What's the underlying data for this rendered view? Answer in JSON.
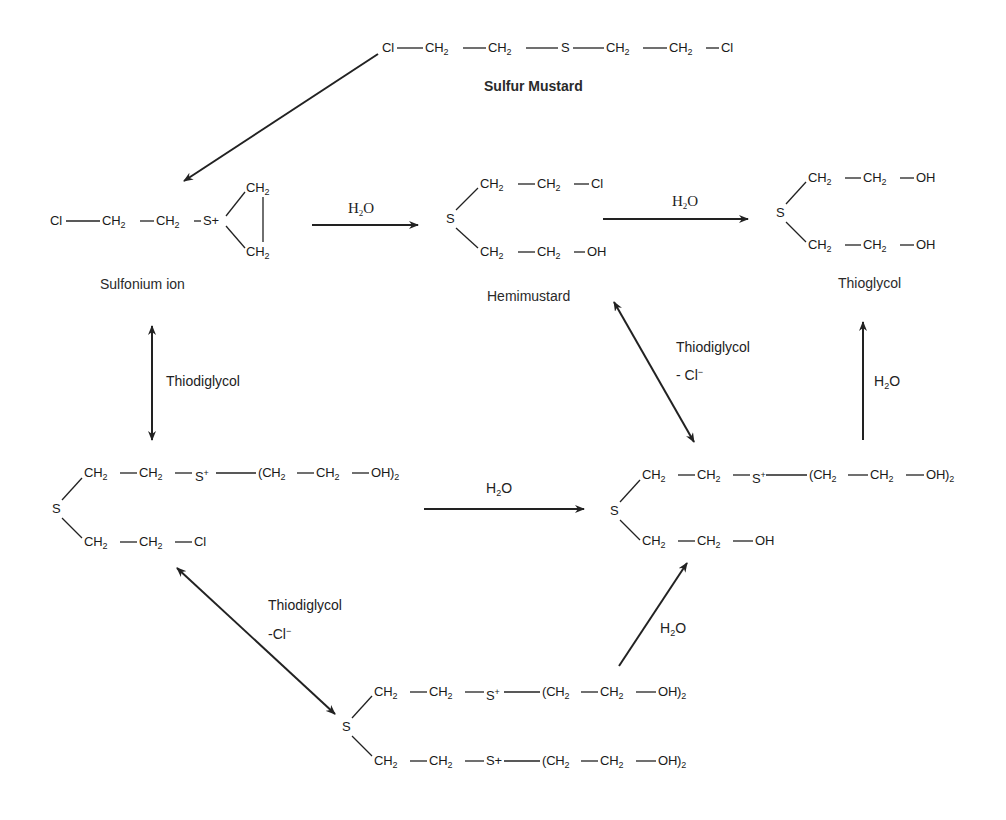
{
  "compounds": {
    "sulfur_mustard": {
      "name": "Sulfur Mustard",
      "formula_parts": [
        "Cl",
        "CH2",
        "CH2",
        "S",
        "CH2",
        "CH2",
        "Cl"
      ],
      "formula_text": "Cl—CH2—CH2—S—CH2—CH2—Cl"
    },
    "sulfonium_ion": {
      "name": "Sulfonium ion",
      "formula_text": "Cl—CH2—CH2—S+ (ring with CH2, CH2)"
    },
    "hemimustard": {
      "name": "Hemimustard",
      "upper_branch": "CH2—CH2—Cl",
      "lower_branch": "CH2—CH2—OH",
      "center": "S"
    },
    "thioglycol": {
      "name": "Thioglycol",
      "upper_branch": "CH2—CH2—OH",
      "lower_branch": "CH2—CH2—OH",
      "center": "S"
    },
    "intermediate_left": {
      "upper_branch": "CH2—CH2—S+—(CH2—CH2—OH)2",
      "lower_branch": "CH2—CH2—Cl",
      "center": "S"
    },
    "intermediate_right": {
      "upper_branch": "CH2—CH2—S+—(CH2—CH2—OH)2",
      "lower_branch": "CH2—CH2—OH",
      "center": "S"
    },
    "intermediate_bottom": {
      "upper_branch": "CH2—CH2—S+—(CH2—CH2—OH)2",
      "lower_branch": "CH2—CH2—S+—(CH2—CH2—OH)2",
      "center": "S"
    }
  },
  "reagents": {
    "water": "H2O",
    "thiodiglycol": "Thiodiglycol",
    "chloride_loss_1": "- Cl",
    "chloride_loss_2": "-Cl"
  },
  "arrows": [
    {
      "from": "Sulfur Mustard",
      "to": "Sulfonium ion",
      "type": "single"
    },
    {
      "from": "Sulfonium ion",
      "to": "Hemimustard",
      "type": "single",
      "label": "H2O"
    },
    {
      "from": "Hemimustard",
      "to": "Thioglycol",
      "type": "single",
      "label": "H2O"
    },
    {
      "from": "Sulfonium ion",
      "to": "Left intermediate",
      "type": "double",
      "label": "Thiodiglycol"
    },
    {
      "from": "Hemimustard",
      "to": "Right intermediate",
      "type": "double",
      "label": "Thiodiglycol - Cl-"
    },
    {
      "from": "Right intermediate",
      "to": "Thioglycol",
      "type": "single",
      "label": "H2O"
    },
    {
      "from": "Left intermediate",
      "to": "Right intermediate",
      "type": "single",
      "label": "H2O"
    },
    {
      "from": "Left intermediate",
      "to": "Bottom intermediate",
      "type": "double",
      "label": "Thiodiglycol -Cl-"
    },
    {
      "from": "Bottom intermediate",
      "to": "Right intermediate",
      "type": "single",
      "label": "H2O"
    }
  ]
}
